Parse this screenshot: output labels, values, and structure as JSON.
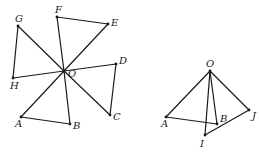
{
  "figures": [
    {
      "id": "left-figure",
      "description": "Four triangles sharing common vertex O, arranged rotationally",
      "points": [
        "O",
        "A",
        "B",
        "C",
        "D",
        "E",
        "F",
        "G",
        "H"
      ],
      "triangles": [
        [
          "O",
          "A",
          "B"
        ],
        [
          "O",
          "C",
          "D"
        ],
        [
          "O",
          "E",
          "F"
        ],
        [
          "O",
          "G",
          "H"
        ]
      ]
    },
    {
      "id": "right-figure",
      "description": "Two triangles sharing common vertex O, one rotated from the other",
      "points": [
        "O",
        "A",
        "B",
        "I",
        "J"
      ],
      "triangles": [
        [
          "O",
          "A",
          "B"
        ],
        [
          "O",
          "I",
          "J"
        ]
      ]
    }
  ],
  "labels": {
    "left": {
      "O": "O",
      "A": "A",
      "B": "B",
      "C": "C",
      "D": "D",
      "E": "E",
      "F": "F",
      "G": "G",
      "H": "H"
    },
    "right": {
      "O": "O",
      "A": "A",
      "B": "B",
      "I": "I",
      "J": "J"
    }
  }
}
